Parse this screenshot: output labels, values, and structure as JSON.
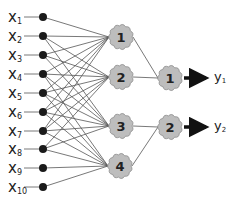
{
  "colors": {
    "background": "#ffffff",
    "node_fill": "#1a1a1a",
    "cloud_fill": "#bdbdbd",
    "cloud_stroke": "#8a8a8a",
    "edge": "#555555",
    "arrow": "#111111",
    "text": "#222222"
  },
  "inputs": [
    {
      "label": "x",
      "sub": "1",
      "y": 17
    },
    {
      "label": "x",
      "sub": "2",
      "y": 36
    },
    {
      "label": "x",
      "sub": "3",
      "y": 55
    },
    {
      "label": "x",
      "sub": "4",
      "y": 74
    },
    {
      "label": "x",
      "sub": "5",
      "y": 93
    },
    {
      "label": "x",
      "sub": "6",
      "y": 112
    },
    {
      "label": "x",
      "sub": "7",
      "y": 131
    },
    {
      "label": "x",
      "sub": "8",
      "y": 149
    },
    {
      "label": "x",
      "sub": "9",
      "y": 168
    },
    {
      "label": "x",
      "sub": "10",
      "y": 187
    }
  ],
  "hidden": [
    {
      "label": "1",
      "x": 121,
      "y": 37
    },
    {
      "label": "2",
      "x": 121,
      "y": 77
    },
    {
      "label": "3",
      "x": 121,
      "y": 126
    },
    {
      "label": "4",
      "x": 120,
      "y": 166
    }
  ],
  "outputs": [
    {
      "label": "1",
      "x": 170,
      "y": 78,
      "out_label": "y",
      "out_sub": "1"
    },
    {
      "label": "2",
      "x": 170,
      "y": 127,
      "out_label": "y",
      "out_sub": "2"
    }
  ],
  "input_hidden_edges": [
    [
      0,
      0
    ],
    [
      1,
      0
    ],
    [
      1,
      1
    ],
    [
      1,
      2
    ],
    [
      2,
      0
    ],
    [
      2,
      1
    ],
    [
      2,
      2
    ],
    [
      3,
      0
    ],
    [
      3,
      1
    ],
    [
      3,
      2
    ],
    [
      3,
      3
    ],
    [
      4,
      0
    ],
    [
      4,
      1
    ],
    [
      4,
      2
    ],
    [
      4,
      3
    ],
    [
      5,
      0
    ],
    [
      5,
      1
    ],
    [
      5,
      2
    ],
    [
      5,
      3
    ],
    [
      6,
      0
    ],
    [
      6,
      1
    ],
    [
      6,
      2
    ],
    [
      6,
      3
    ],
    [
      7,
      1
    ],
    [
      7,
      2
    ],
    [
      7,
      3
    ],
    [
      8,
      3
    ],
    [
      9,
      3
    ]
  ],
  "hidden_output_edges": [
    [
      0,
      0
    ],
    [
      1,
      0
    ],
    [
      2,
      1
    ],
    [
      3,
      1
    ]
  ]
}
